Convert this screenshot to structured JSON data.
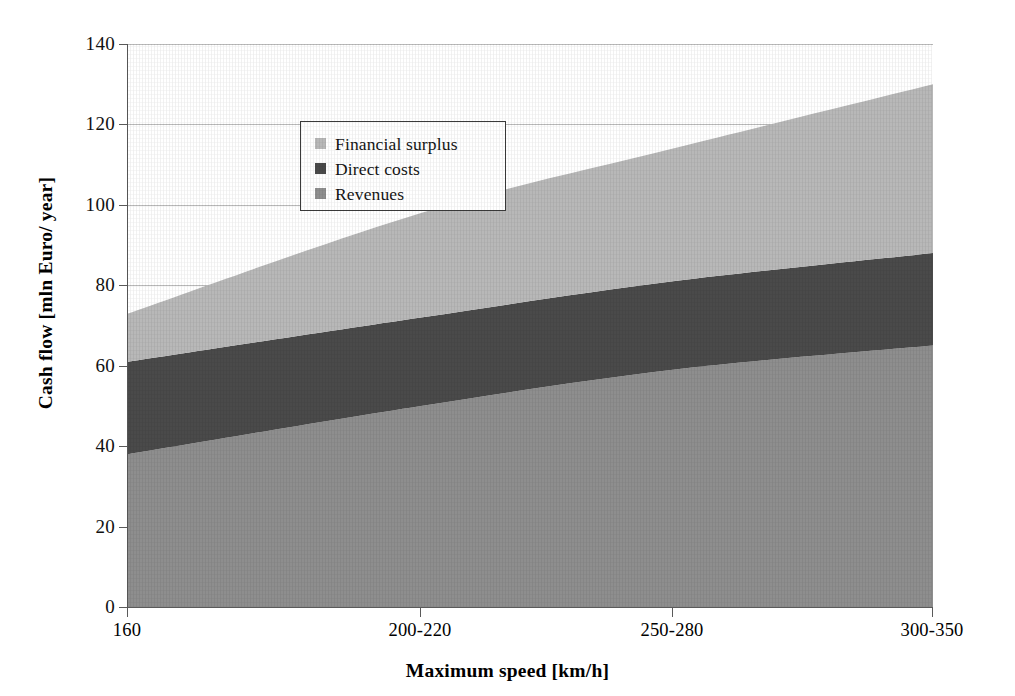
{
  "chart_data": {
    "type": "area",
    "title": "",
    "subtitle": "",
    "xlabel": "Maximum speed [km/h]",
    "ylabel": "Cash flow [mln Euro/ year]",
    "categories": [
      "160",
      "200-220",
      "250-280",
      "300-350"
    ],
    "x_positions_px": [
      0,
      293,
      545,
      805
    ],
    "ylim": [
      0,
      140
    ],
    "y_ticks": [
      0,
      20,
      40,
      60,
      80,
      100,
      120,
      140
    ],
    "xlim_categorical": true,
    "grid": "horizontal",
    "legend_position": "top-left-inside",
    "stacking": "stacked",
    "series": [
      {
        "name": "Revenues",
        "color": "#8e8e8e",
        "values": [
          38,
          50,
          59,
          65
        ],
        "cumulative_top": [
          38,
          50,
          59,
          65
        ]
      },
      {
        "name": "Direct costs",
        "color": "#4a4a4a",
        "values": [
          23,
          22,
          22,
          23
        ],
        "cumulative_top": [
          61,
          72,
          81,
          88
        ]
      },
      {
        "name": "Financial surplus",
        "color": "#b8b8b8",
        "values": [
          12,
          26,
          33,
          42
        ],
        "cumulative_top": [
          73,
          98,
          114,
          130
        ]
      }
    ],
    "legend_order": [
      "Financial surplus",
      "Direct costs",
      "Revenues"
    ]
  },
  "axes": {
    "y": {
      "title": "Cash flow [mln Euro/ year]",
      "tick_labels": [
        "140",
        "120",
        "100",
        "80",
        "60",
        "40",
        "20",
        "0"
      ]
    },
    "x": {
      "title": "Maximum speed [km/h]",
      "tick_labels": [
        "160",
        "200-220",
        "250-280",
        "300-350"
      ]
    }
  },
  "legend": {
    "entries": [
      {
        "label": "Financial surplus",
        "color": "#b8b8b8"
      },
      {
        "label": "Direct costs",
        "color": "#4a4a4a"
      },
      {
        "label": "Revenues",
        "color": "#8e8e8e"
      }
    ]
  },
  "colors": {
    "financial_surplus": "#b8b8b8",
    "direct_costs": "#4a4a4a",
    "revenues": "#8e8e8e",
    "gridline": "#b9b9b9",
    "axis": "#5a5a5a",
    "background": "#ffffff"
  }
}
